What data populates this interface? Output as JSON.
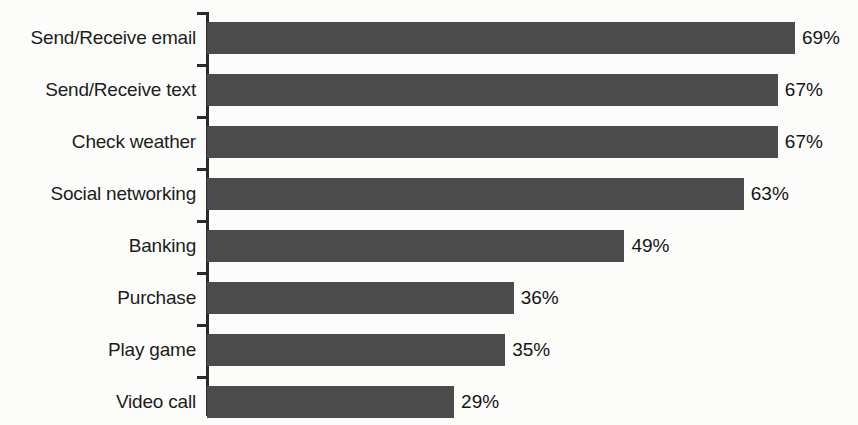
{
  "title_remnant": "",
  "chart_data": {
    "type": "bar",
    "orientation": "horizontal",
    "title": "",
    "subtitle": "",
    "xlabel": "",
    "ylabel": "",
    "xlim": [
      0,
      75
    ],
    "grid": false,
    "legend": null,
    "value_suffix": "%",
    "categories": [
      "Send/Receive email",
      "Send/Receive text",
      "Check weather",
      "Social networking",
      "Banking",
      "Purchase",
      "Play game",
      "Video call"
    ],
    "values": [
      69,
      67,
      67,
      63,
      49,
      36,
      35,
      29
    ],
    "value_labels": [
      "69%",
      "67%",
      "67%",
      "63%",
      "49%",
      "36%",
      "35%",
      "29%"
    ],
    "bar_color": "#4b4b4b",
    "axis_color": "#2b2b2b",
    "label_color": "#1c1c1c",
    "background_color": "#fcfcfa"
  }
}
